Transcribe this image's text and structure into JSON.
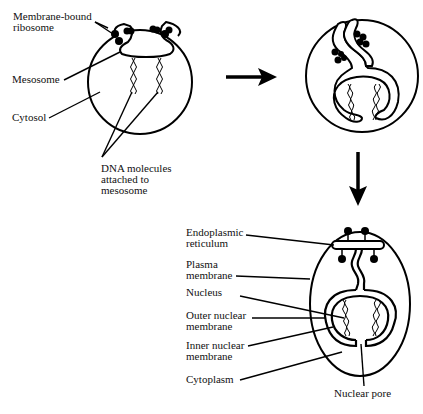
{
  "figure": {
    "panels": [
      {
        "id": "prokaryote",
        "labels": [
          {
            "key": "membrane_bound_ribosome",
            "lines": [
              "Membrane-bound",
              "ribosome"
            ]
          },
          {
            "key": "mesosome",
            "lines": [
              "Mesosome"
            ]
          },
          {
            "key": "cytosol",
            "lines": [
              "Cytosol"
            ]
          },
          {
            "key": "dna_molecules",
            "lines": [
              "DNA molecules",
              "attached to",
              "mesosome"
            ]
          }
        ]
      },
      {
        "id": "intermediate",
        "labels": []
      },
      {
        "id": "eukaryote",
        "labels": [
          {
            "key": "endoplasmic_reticulum",
            "lines": [
              "Endoplasmic",
              "reticulum"
            ]
          },
          {
            "key": "plasma_membrane",
            "lines": [
              "Plasma",
              "membrane"
            ]
          },
          {
            "key": "nucleus",
            "lines": [
              "Nucleus"
            ]
          },
          {
            "key": "outer_nuclear_membrane",
            "lines": [
              "Outer nuclear",
              "membrane"
            ]
          },
          {
            "key": "inner_nuclear_membrane",
            "lines": [
              "Inner nuclear",
              "membrane"
            ]
          },
          {
            "key": "cytoplasm",
            "lines": [
              "Cytoplasm"
            ]
          },
          {
            "key": "nuclear_pore",
            "lines": [
              "Nuclear pore"
            ]
          }
        ]
      }
    ],
    "arrows": [
      {
        "from": "prokaryote",
        "to": "intermediate",
        "direction": "right"
      },
      {
        "from": "intermediate",
        "to": "eukaryote",
        "direction": "down"
      }
    ]
  },
  "t": {
    "mbr1": "Membrane-bound",
    "mbr2": "ribosome",
    "meso": "Mesosome",
    "cyto": "Cytosol",
    "dna1": "DNA molecules",
    "dna2": "attached to",
    "dna3": "mesosome",
    "er1": "Endoplasmic",
    "er2": "reticulum",
    "pm1": "Plasma",
    "pm2": "membrane",
    "nuc": "Nucleus",
    "onm1": "Outer nuclear",
    "onm2": "membrane",
    "inm1": "Inner nuclear",
    "inm2": "membrane",
    "cytop": "Cytoplasm",
    "pore": "Nuclear pore"
  }
}
